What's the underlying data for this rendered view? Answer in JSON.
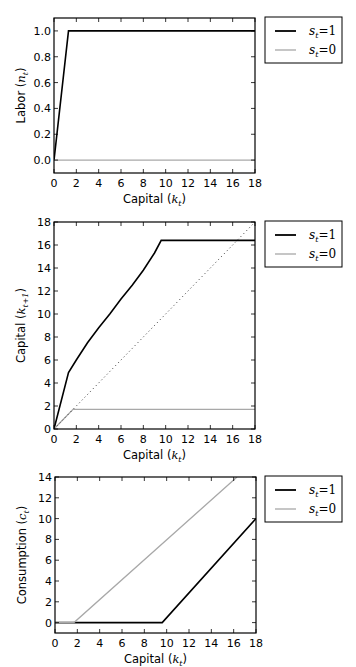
{
  "colors": {
    "s1": "#000000",
    "s0": "#a8a8a8",
    "diagonal": "#333333",
    "frame": "#000000"
  },
  "legend": {
    "entries": [
      {
        "label": "s_t = 1",
        "display": "s",
        "sub": "t",
        "eq": "=1",
        "color": "#000000"
      },
      {
        "label": "s_t = 0",
        "display": "s",
        "sub": "t",
        "eq": "=0",
        "color": "#a8a8a8"
      }
    ],
    "position": "outside upper right"
  },
  "chart_data": [
    {
      "type": "line",
      "title": "",
      "xlabel": "Capital (k_t)",
      "ylabel": "Labor (n_t)",
      "xlabel_text": "Capital (",
      "xlabel_var": "k",
      "xlabel_sub": "t",
      "ylabel_text": "Labor (",
      "ylabel_var": "n",
      "ylabel_sub": "t",
      "xlim": [
        0,
        18
      ],
      "ylim": [
        -0.1,
        1.1
      ],
      "xticks": [
        0,
        2,
        4,
        6,
        8,
        10,
        12,
        14,
        16,
        18
      ],
      "yticks": [
        0.0,
        0.2,
        0.4,
        0.6,
        0.8,
        1.0
      ],
      "ytick_labels": [
        "0.0",
        "0.2",
        "0.4",
        "0.6",
        "0.8",
        "1.0"
      ],
      "grid": false,
      "series": [
        {
          "name": "s_t=1",
          "x": [
            0,
            1.3,
            18
          ],
          "y": [
            0,
            1.0,
            1.0
          ]
        },
        {
          "name": "s_t=0",
          "x": [
            0,
            18
          ],
          "y": [
            0,
            0
          ]
        }
      ]
    },
    {
      "type": "line",
      "title": "",
      "xlabel": "Capital (k_t)",
      "ylabel": "Capital (k_{t+1})",
      "xlabel_text": "Capital (",
      "xlabel_var": "k",
      "xlabel_sub": "t",
      "ylabel_text": "Capital (",
      "ylabel_var": "k",
      "ylabel_sub": "t+1",
      "xlim": [
        0,
        18
      ],
      "ylim": [
        0,
        18
      ],
      "xticks": [
        0,
        2,
        4,
        6,
        8,
        10,
        12,
        14,
        16,
        18
      ],
      "yticks": [
        0,
        2,
        4,
        6,
        8,
        10,
        12,
        14,
        16,
        18
      ],
      "ytick_labels": [
        "0",
        "2",
        "4",
        "6",
        "8",
        "10",
        "12",
        "14",
        "16",
        "18"
      ],
      "grid": false,
      "series": [
        {
          "name": "s_t=1",
          "x": [
            0,
            1.3,
            2,
            3,
            4,
            5,
            6,
            7,
            8,
            9,
            9.6,
            18
          ],
          "y": [
            0,
            4.9,
            6.0,
            7.5,
            8.8,
            10.0,
            11.3,
            12.5,
            13.8,
            15.3,
            16.4,
            16.4
          ]
        },
        {
          "name": "s_t=0",
          "x": [
            0,
            1.7,
            18
          ],
          "y": [
            0,
            1.7,
            1.7
          ]
        },
        {
          "name": "45-degree",
          "x": [
            0,
            18
          ],
          "y": [
            0,
            18
          ],
          "style": "dotted"
        }
      ]
    },
    {
      "type": "line",
      "title": "",
      "xlabel": "Capital (k_t)",
      "ylabel": "Consumption (c_t)",
      "xlabel_text": "Capital (",
      "xlabel_var": "k",
      "xlabel_sub": "t",
      "ylabel_text": "Consumption (",
      "ylabel_var": "c",
      "ylabel_sub": "t",
      "xlim": [
        0,
        18
      ],
      "ylim": [
        -1,
        14
      ],
      "xticks": [
        0,
        2,
        4,
        6,
        8,
        10,
        12,
        14,
        16,
        18
      ],
      "yticks": [
        0,
        2,
        4,
        6,
        8,
        10,
        12,
        14
      ],
      "ytick_labels": [
        "0",
        "2",
        "4",
        "6",
        "8",
        "10",
        "12",
        "14"
      ],
      "grid": false,
      "series": [
        {
          "name": "s_t=1",
          "x": [
            0,
            9.6,
            18
          ],
          "y": [
            0,
            0,
            10.0
          ]
        },
        {
          "name": "s_t=0",
          "x": [
            0,
            1.7,
            16.3
          ],
          "y": [
            0,
            0,
            14
          ]
        }
      ]
    }
  ]
}
